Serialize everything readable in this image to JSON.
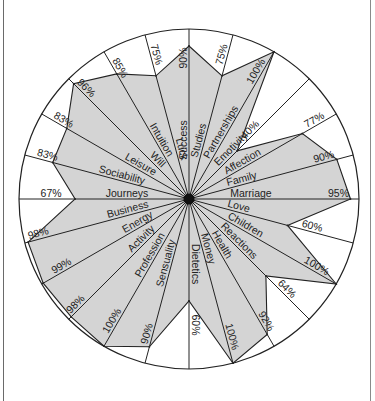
{
  "chart_data": {
    "type": "radar",
    "title": "",
    "value_unit": "%",
    "range": [
      0,
      100
    ],
    "grid": false,
    "legend": "none",
    "fill_color": "#d4d4d4",
    "line_color": "#222222",
    "categories": [
      "Success",
      "Studies",
      "Partnerships",
      "Emotivity",
      "Affection",
      "Family",
      "Marriage",
      "Love",
      "Children",
      "Reactions",
      "Health",
      "Money",
      "Dietetics",
      "Sensuality",
      "Profession",
      "Activity",
      "Energy",
      "Business",
      "Journeys",
      "Sociability",
      "Leisure",
      "Will",
      "Intuition",
      "Luck"
    ],
    "values": [
      90,
      75,
      100,
      40,
      77,
      90,
      95,
      60,
      100,
      64,
      92,
      100,
      60,
      90,
      100,
      98,
      99,
      98,
      67,
      83,
      83,
      96,
      85,
      75
    ],
    "value_labels": [
      "90%",
      "75%",
      "100%",
      "40%",
      "77%",
      "90%",
      "95%",
      "60%",
      "100%",
      "64%",
      "92%",
      "100%",
      "60%",
      "90%",
      "100%",
      "98%",
      "99%",
      "98%",
      "67%",
      "83%",
      "83%",
      "96%",
      "85%",
      "75%"
    ]
  }
}
